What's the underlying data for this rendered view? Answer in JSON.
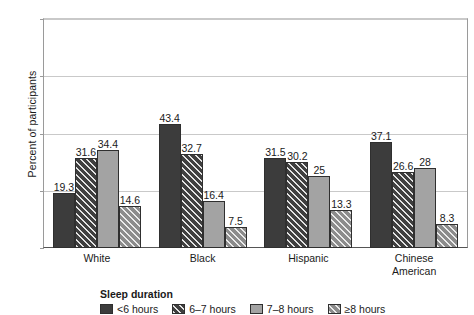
{
  "chart_data": {
    "type": "bar",
    "title": "",
    "xlabel": "",
    "ylabel": "Percent of participants",
    "ylim": [
      0,
      80
    ],
    "yticks": [
      0,
      20,
      40,
      60,
      80
    ],
    "grid": true,
    "legend_position": "bottom-left",
    "legend_title": "Sleep duration",
    "categories": [
      "White",
      "Black",
      "Hispanic",
      "Chinese American"
    ],
    "series": [
      {
        "name": "<6 hours",
        "values": [
          19.3,
          43.4,
          31.5,
          37.1
        ]
      },
      {
        "name": "6–7 hours",
        "values": [
          31.6,
          32.7,
          30.2,
          26.6
        ]
      },
      {
        "name": "7–8 hours",
        "values": [
          34.4,
          16.4,
          25,
          28
        ]
      },
      {
        "name": "≥8 hours",
        "values": [
          14.6,
          7.5,
          13.3,
          8.3
        ]
      }
    ],
    "data_labels": [
      [
        "19.3",
        "31.6",
        "34.4",
        "14.6"
      ],
      [
        "43.4",
        "32.7",
        "16.4",
        "7.5"
      ],
      [
        "31.5",
        "30.2",
        "25",
        "13.3"
      ],
      [
        "37.1",
        "26.6",
        "28",
        "8.3"
      ]
    ]
  },
  "axis": {
    "y_title": "Percent of participants",
    "y_ticks": [
      "80",
      "60",
      "40",
      "20",
      "0"
    ],
    "x_categories": [
      {
        "line1": "White",
        "line2": ""
      },
      {
        "line1": "Black",
        "line2": ""
      },
      {
        "line1": "Hispanic",
        "line2": ""
      },
      {
        "line1": "Chinese",
        "line2": "American"
      }
    ]
  },
  "legend": {
    "title": "Sleep duration",
    "items": [
      {
        "label": "<6 hours"
      },
      {
        "label": "6–7 hours"
      },
      {
        "label": "7–8 hours"
      },
      {
        "label": "≥8 hours"
      }
    ]
  },
  "colors": {
    "series_0": "#3c3c3c",
    "series_1": "#3f3f3f",
    "series_2": "#a3a3a3",
    "series_3": "#8c8c8c",
    "grid": "#c9c9c9",
    "axis": "#555555",
    "text": "#1a1a1a"
  }
}
